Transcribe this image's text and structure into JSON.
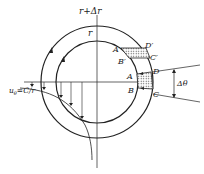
{
  "diagram": {
    "labels": {
      "outer_radius": "r+Δr",
      "inner_radius": "r",
      "A_prime": "A′",
      "B_prime": "B′",
      "C_prime": "C′",
      "D_prime": "D′",
      "A": "A",
      "B": "B",
      "C": "C",
      "D": "D",
      "delta_theta": "Δθ",
      "velocity": "u",
      "velocity_sub": "θ",
      "velocity_eq": "=C/r"
    },
    "colors": {
      "line": "#222222",
      "hatch": "#555555"
    }
  }
}
